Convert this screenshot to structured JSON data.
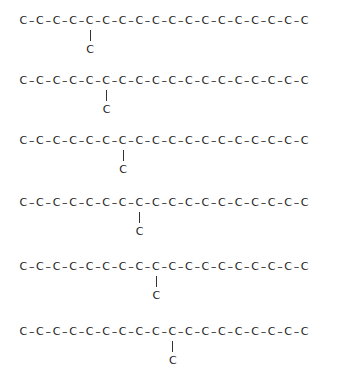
{
  "diagram": {
    "title": "",
    "atom_symbol": "C",
    "bond_symbol": "–",
    "chain_length": 18,
    "structures": [
      {
        "label": "methyl branch at C5",
        "branch_position": 5,
        "branch_atom": "C"
      },
      {
        "label": "methyl branch at C6",
        "branch_position": 6,
        "branch_atom": "C"
      },
      {
        "label": "methyl branch at C7",
        "branch_position": 7,
        "branch_atom": "C"
      },
      {
        "label": "methyl branch at C8",
        "branch_position": 8,
        "branch_atom": "C"
      },
      {
        "label": "methyl branch at C9",
        "branch_position": 9,
        "branch_atom": "C"
      },
      {
        "label": "methyl branch at C10",
        "branch_position": 10,
        "branch_atom": "C"
      }
    ]
  },
  "layout": {
    "row_tops": [
      14,
      74,
      134,
      196,
      260,
      325
    ],
    "chain_left": 18,
    "atom_pitch": 16.55
  }
}
